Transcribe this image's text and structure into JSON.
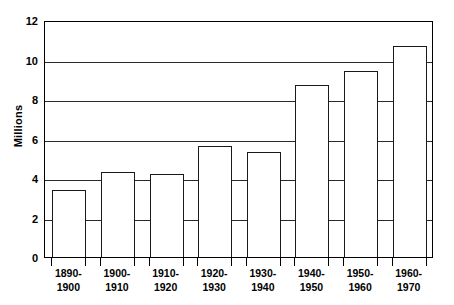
{
  "chart_data": {
    "type": "bar",
    "title": "",
    "subtitle": "",
    "xlabel": "",
    "ylabel": "Millions",
    "categories": [
      "1890-\n1900",
      "1900-\n1910",
      "1910-\n1920",
      "1920-\n1930",
      "1930-\n1940",
      "1940-\n1950",
      "1950-\n1960",
      "1960-\n1970"
    ],
    "values": [
      3.4,
      4.3,
      4.2,
      5.6,
      5.3,
      8.7,
      9.4,
      10.7
    ],
    "ylim": [
      0,
      12
    ],
    "ytick_values": [
      0,
      2,
      4,
      6,
      8,
      10,
      12
    ],
    "ytick_labels": [
      "0",
      "2",
      "4",
      "6",
      "8",
      "10",
      "12"
    ],
    "grid": true,
    "grid_axis": "y",
    "legend": false,
    "legend_position": "none",
    "bar_fill_color": "#ffffff",
    "bar_edge_color": "#1a1a1a",
    "axis_color": "#000000",
    "background_color": "#ffffff"
  }
}
